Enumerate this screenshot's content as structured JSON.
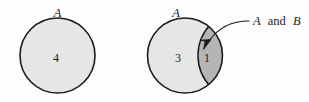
{
  "figure": {
    "kind": "venn-diagram",
    "background_color": "#fdfdfd",
    "stroke_color": "#1b1b1b",
    "fill_light": "#e6e6e6",
    "fill_dark": "#b5b5b5",
    "text_color": "#1b1b1b"
  },
  "left_diagram": {
    "set_label": "A",
    "count": "4"
  },
  "right_diagram": {
    "set_label": "A",
    "count_only_a": "3",
    "count_intersection": "1",
    "callout": {
      "part1": "A",
      "part2": "and",
      "part3": "B"
    }
  }
}
